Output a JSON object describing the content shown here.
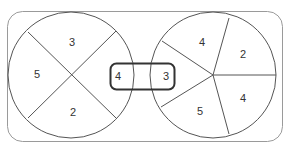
{
  "diagram": {
    "type": "two-pie-venn-like",
    "colors": {
      "background": "#ffffff",
      "frame_stroke": "#9a9a9a",
      "circle_stroke": "#555555",
      "spoke_stroke": "#555555",
      "center_box_stroke": "#333333",
      "text": "#333333"
    },
    "left_circle": {
      "sectors": [
        {
          "position": "top",
          "value": "3"
        },
        {
          "position": "left",
          "value": "5"
        },
        {
          "position": "bottom",
          "value": "2"
        },
        {
          "position": "right",
          "value": "4"
        }
      ]
    },
    "right_circle": {
      "sectors": [
        {
          "position": "top",
          "value": "4"
        },
        {
          "position": "upper-right",
          "value": "2"
        },
        {
          "position": "lower-right",
          "value": "4"
        },
        {
          "position": "bottom",
          "value": "5"
        },
        {
          "position": "left",
          "value": "3"
        }
      ]
    },
    "center_box": {
      "left_value": "4",
      "right_value": "3"
    }
  }
}
